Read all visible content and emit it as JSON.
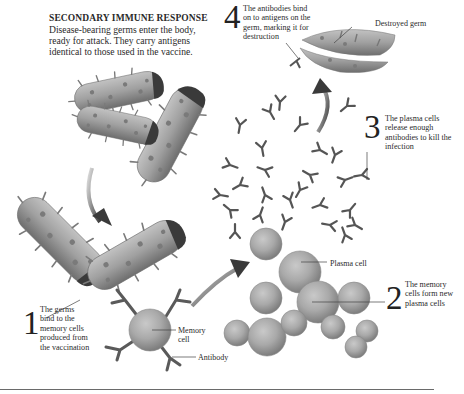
{
  "header": {
    "title": "SECONDARY IMMUNE RESPONSE",
    "intro": "Disease-bearing germs enter the body, ready for attack. They carry antigens identical to those used in the vaccine."
  },
  "steps": [
    {
      "number": "1",
      "text": "The germs bind to the memory cells produced from the vaccination"
    },
    {
      "number": "2",
      "text": "The memory cells form new plasma cells"
    },
    {
      "number": "3",
      "text": "The plasma cells release enough antibodies to kill the infection"
    },
    {
      "number": "4",
      "text": "The antibodies bind on to antigens on the germ, marking it for destruction"
    }
  ],
  "labels": {
    "destroyed_germ": "Destroyed germ",
    "plasma_cell": "Plasma cell",
    "memory_cell": "Memory cell",
    "antibody": "Antibody"
  },
  "colors": {
    "germ_body": "#9a9a9a",
    "germ_cap": "#3c3c3c",
    "cell": "#a8a8a8",
    "antibody": "#5a5a5a",
    "arrow": "#444444"
  }
}
